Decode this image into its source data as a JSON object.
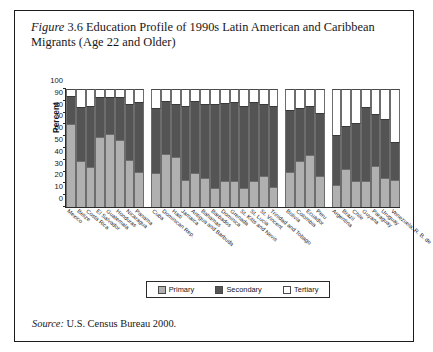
{
  "figure": {
    "label": "Figure",
    "number": "3.6",
    "title": "Education Profile of 1990s Latin American and Caribbean Migrants (Age 22 and Older)",
    "title_line1": "Education Profile of 1990s Latin American and",
    "title_line2": "Caribbean Migrants (Age 22 and Older)"
  },
  "source": {
    "label": "Source:",
    "text": "U.S. Census Bureau 2000."
  },
  "legend": {
    "position": "bottom-center",
    "items": [
      {
        "label": "Primary",
        "color": "#b0b0b0"
      },
      {
        "label": "Secondary",
        "color": "#545454"
      },
      {
        "label": "Tertiary",
        "color": "#ffffff"
      }
    ]
  },
  "axes": {
    "ylabel": "Percent",
    "yticks": [
      0,
      10,
      20,
      30,
      40,
      50,
      60,
      70,
      80,
      90,
      100
    ],
    "ylim": [
      0,
      100
    ],
    "grid": false
  },
  "chart_data": {
    "type": "bar",
    "subtype": "stacked-100-percent",
    "title": "Education Profile of 1990s Latin American and Caribbean Migrants (Age 22 and Older)",
    "xlabel": "",
    "ylabel": "Percent",
    "ylim": [
      0,
      100
    ],
    "grid": false,
    "legend_position": "bottom-center",
    "categories": [
      "Mexico",
      "Belize",
      "Costa Rica",
      "El Salvador",
      "Guatemala",
      "Honduras",
      "Nicaragua",
      "Panama",
      "Cuba",
      "Dominican Rep.",
      "Haiti",
      "Jamaica",
      "Antigua and Barbuda",
      "Bahamas",
      "Barbados",
      "Dominica",
      "Grenada",
      "St. Kitts and Nevis",
      "St. Lucia",
      "St. Vincent",
      "Trinidad and Tobago",
      "Bolivia",
      "Colombia",
      "Ecuador",
      "Peru",
      "Argentina",
      "Brazil",
      "Chile",
      "Guyana",
      "Paraguay",
      "Uruguay",
      "Venezuela, R. B. de"
    ],
    "group_breaks_after": [
      "Panama",
      "Trinidad and Tobago",
      "Peru"
    ],
    "series": [
      {
        "name": "Primary",
        "color": "#b0b0b0",
        "values": [
          70,
          39,
          34,
          59,
          62,
          57,
          40,
          30,
          29,
          45,
          42,
          23,
          29,
          25,
          16,
          22,
          22,
          16,
          22,
          26,
          17,
          30,
          39,
          44,
          26,
          19,
          32,
          22,
          22,
          35,
          25,
          23
        ]
      },
      {
        "name": "Secondary",
        "color": "#545454",
        "values": [
          24,
          46,
          52,
          34,
          31,
          36,
          47,
          59,
          55,
          45,
          45,
          63,
          61,
          62,
          71,
          66,
          67,
          70,
          67,
          61,
          69,
          52,
          45,
          42,
          54,
          42,
          37,
          49,
          63,
          44,
          50,
          32
        ]
      },
      {
        "name": "Tertiary",
        "color": "#ffffff",
        "values": [
          6,
          15,
          14,
          7,
          7,
          7,
          13,
          11,
          16,
          10,
          13,
          14,
          10,
          13,
          13,
          12,
          11,
          14,
          11,
          13,
          14,
          18,
          16,
          14,
          20,
          39,
          31,
          29,
          15,
          21,
          25,
          45
        ]
      }
    ]
  }
}
